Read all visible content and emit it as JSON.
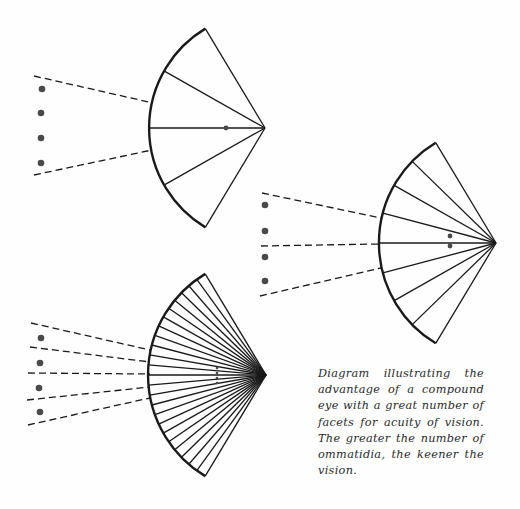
{
  "caption": {
    "lines": [
      "Diagram illustrating the",
      "advantage of a compound",
      "eye with a great number of",
      "facets for acuity of vision.",
      "The greater the number of",
      "ommatidia, the keener the",
      "vision."
    ],
    "full_text": "Diagram illustrating the advantage of a compound eye with a great number of facets for acuity of vision. The greater the number of ommatidia, the keener the vision."
  },
  "colors": {
    "ink": "#1a1a1a",
    "dot": "#4a4a4a",
    "background": "#fefefe"
  },
  "fans": [
    {
      "name": "few-facets-eye",
      "apex": [
        265,
        128
      ],
      "radius": 116,
      "half_angle_deg": 59,
      "sectors": 4,
      "image_dots": [
        [
          226,
          128
        ]
      ],
      "object_dots": [
        [
          42,
          89
        ],
        [
          41,
          113
        ],
        [
          41,
          138
        ],
        [
          41,
          163
        ]
      ],
      "rays": [
        [
          [
            34,
            76
          ],
          [
            153,
            103
          ]
        ],
        [
          [
            34,
            175
          ],
          [
            152,
            150
          ]
        ]
      ]
    },
    {
      "name": "medium-facets-eye",
      "apex": [
        496,
        243
      ],
      "radius": 117,
      "half_angle_deg": 59,
      "sectors": 8,
      "image_dots": [
        [
          450,
          236
        ],
        [
          450,
          246
        ]
      ],
      "object_dots": [
        [
          265,
          205
        ],
        [
          265,
          231
        ],
        [
          265,
          257
        ],
        [
          265,
          281
        ]
      ],
      "rays": [
        [
          [
            262,
            193
          ],
          [
            381,
            218
          ]
        ],
        [
          [
            261,
            246
          ],
          [
            380,
            244
          ]
        ],
        [
          [
            260,
            296
          ],
          [
            381,
            268
          ]
        ]
      ]
    },
    {
      "name": "many-facets-eye",
      "apex": [
        266,
        375
      ],
      "radius": 118,
      "half_angle_deg": 59,
      "sectors": 24,
      "image_dots": [
        [
          217,
          368
        ],
        [
          217,
          373
        ],
        [
          217,
          378
        ],
        [
          217,
          383
        ]
      ],
      "object_dots": [
        [
          41,
          338
        ],
        [
          40,
          363
        ],
        [
          39,
          388
        ],
        [
          40,
          412
        ]
      ],
      "rays": [
        [
          [
            31,
            323
          ],
          [
            150,
            350
          ]
        ],
        [
          [
            30,
            347
          ],
          [
            150,
            362
          ]
        ],
        [
          [
            28,
            373
          ],
          [
            150,
            374
          ]
        ],
        [
          [
            27,
            400
          ],
          [
            150,
            387
          ]
        ],
        [
          [
            28,
            425
          ],
          [
            150,
            398
          ]
        ]
      ]
    }
  ]
}
